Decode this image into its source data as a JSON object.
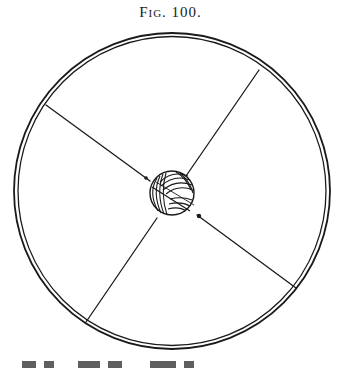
{
  "figure": {
    "caption": "Fig. 100.",
    "colors": {
      "ink": "#1a1a1a",
      "background": "#ffffff"
    },
    "wheel": {
      "center": [
        172,
        191
      ],
      "outer_radius": 158,
      "inner_radius": 154,
      "spoke_count": 4
    },
    "hub": {
      "type": "ball-of-string",
      "center": [
        172,
        193
      ],
      "radius": 22
    }
  }
}
